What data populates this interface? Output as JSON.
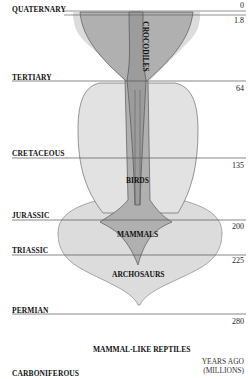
{
  "periods": [
    {
      "name": "QUATERNARY",
      "age": "0"
    },
    {
      "name": "",
      "age": "1.8"
    },
    {
      "name": "TERTIARY",
      "age": "64"
    },
    {
      "name": "CRETACEOUS",
      "age": "135"
    },
    {
      "name": "JURASSIC",
      "age": "200"
    },
    {
      "name": "TRIASSIC",
      "age": "225"
    },
    {
      "name": "PERMIAN",
      "age": "280"
    },
    {
      "name": "CARBONIFEROUS",
      "age": ""
    }
  ],
  "clades": {
    "crocodiles": "CROCODILES",
    "birds": "BIRDS",
    "mammals": "MAMMALS",
    "archosaurs": "ARCHOSAURS",
    "mammal_like_reptiles": "MAMMAL-LIKE REPTILES"
  },
  "axis": {
    "line1": "YEARS AGO",
    "line2": "(MILLIONS)"
  },
  "colors": {
    "light_fill": "#d9d9d9",
    "mid_fill": "#b3b3b3",
    "dark_fill": "#9a9a9a",
    "outline": "#444444",
    "rule": "#555555"
  }
}
